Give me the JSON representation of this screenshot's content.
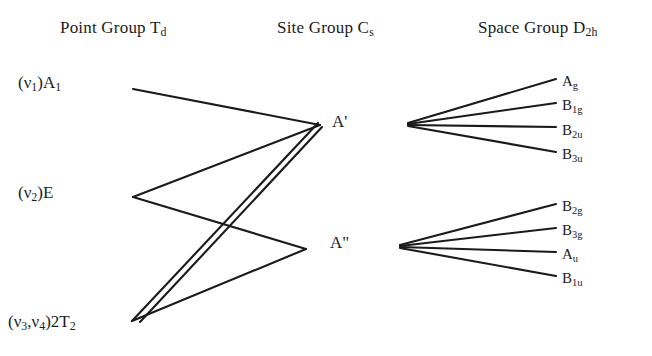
{
  "diagram": {
    "type": "correlation-diagram",
    "columns": [
      {
        "id": "point_group",
        "label_prefix": "Point Group ",
        "symbol": "T",
        "symbol_sub": "d",
        "full": "Point Group Td"
      },
      {
        "id": "site_group",
        "label_prefix": "Site Group ",
        "symbol": "C",
        "symbol_sub": "s",
        "full": "Site Group Cs"
      },
      {
        "id": "space_group",
        "label_prefix": "Space Group ",
        "symbol": "D",
        "symbol_sub": "2h",
        "full": "Space Group D2h"
      }
    ],
    "point_group_terms": [
      {
        "id": "a1",
        "mode": "(ν₁)",
        "term": "A",
        "term_sub": "1",
        "full": "(ν1)A1"
      },
      {
        "id": "e",
        "mode": "(ν₂)",
        "term": "E",
        "term_sub": "",
        "full": "(ν2)E"
      },
      {
        "id": "2t2",
        "mode": "(ν₃,ν₄)",
        "term": "2T",
        "term_sub": "2",
        "full": "(ν3,ν4)2T2"
      }
    ],
    "site_group_terms": [
      {
        "id": "aprime",
        "full": "A'"
      },
      {
        "id": "adprime",
        "full": "A\""
      }
    ],
    "space_group_terms_upper": [
      {
        "id": "ag",
        "letter": "A",
        "sub": "g"
      },
      {
        "id": "b1g",
        "letter": "B",
        "sub": "1g"
      },
      {
        "id": "b2u",
        "letter": "B",
        "sub": "2u"
      },
      {
        "id": "b3u",
        "letter": "B",
        "sub": "3u"
      }
    ],
    "space_group_terms_lower": [
      {
        "id": "b2g",
        "letter": "B",
        "sub": "2g"
      },
      {
        "id": "b3g",
        "letter": "B",
        "sub": "3g"
      },
      {
        "id": "au",
        "letter": "A",
        "sub": "u"
      },
      {
        "id": "b1u",
        "letter": "B",
        "sub": "1u"
      }
    ],
    "correlations": [
      {
        "from": "a1",
        "to": "aprime"
      },
      {
        "from": "e",
        "to": "aprime"
      },
      {
        "from": "e",
        "to": "adprime"
      },
      {
        "from": "2t2",
        "to": "aprime"
      },
      {
        "from": "2t2",
        "to": "aprime"
      },
      {
        "from": "2t2",
        "to": "adprime"
      },
      {
        "from": "aprime",
        "to": "ag"
      },
      {
        "from": "aprime",
        "to": "b1g"
      },
      {
        "from": "aprime",
        "to": "b2u"
      },
      {
        "from": "aprime",
        "to": "b3u"
      },
      {
        "from": "adprime",
        "to": "b2g"
      },
      {
        "from": "adprime",
        "to": "b3g"
      },
      {
        "from": "adprime",
        "to": "au"
      },
      {
        "from": "adprime",
        "to": "b1u"
      }
    ],
    "line_color": "#1a1a1a",
    "background_color": "#ffffff"
  },
  "headers": {
    "point_prefix": "Point Group ",
    "point_symbol": "T",
    "point_sub": "d",
    "site_prefix": "Site Group ",
    "site_symbol": "C",
    "site_sub": "s",
    "space_prefix": "Space Group ",
    "space_symbol": "D",
    "space_sub": "2h"
  },
  "left_terms": {
    "a1_mode": "(ν",
    "a1_mode_sub": "1",
    "a1_close": ")A",
    "a1_sub": "1",
    "e_mode": "(ν",
    "e_mode_sub": "2",
    "e_close": ")E",
    "t2_mode": "(ν",
    "t2_mode_sub1": "3",
    "t2_comma": ",ν",
    "t2_mode_sub2": "4",
    "t2_close": ")2T",
    "t2_sub": "2"
  },
  "middle_terms": {
    "aprime": "A'",
    "adprime": "A\""
  },
  "right_terms": {
    "ag_letter": "A",
    "ag_sub": "g",
    "b1g_letter": "B",
    "b1g_sub": "1g",
    "b2u_letter": "B",
    "b2u_sub": "2u",
    "b3u_letter": "B",
    "b3u_sub": "3u",
    "b2g_letter": "B",
    "b2g_sub": "2g",
    "b3g_letter": "B",
    "b3g_sub": "3g",
    "au_letter": "A",
    "au_sub": "u",
    "b1u_letter": "B",
    "b1u_sub": "1u"
  }
}
